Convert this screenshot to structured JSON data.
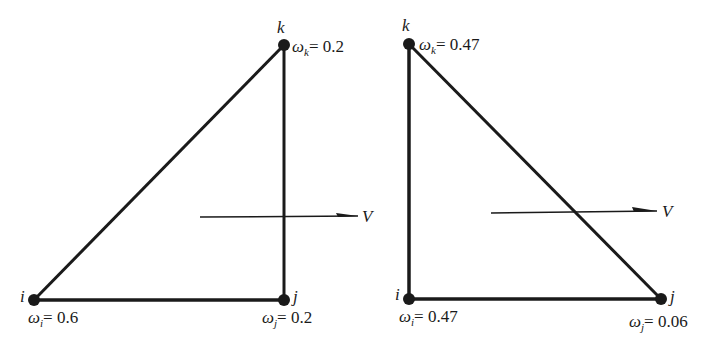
{
  "diagrams": [
    {
      "name": "left-triangle",
      "nodes": {
        "i": {
          "label": "i",
          "x": 34,
          "y": 300,
          "weight_symbol": "ω",
          "weight_sub": "i",
          "weight_eq": "= 0.6"
        },
        "j": {
          "label": "j",
          "x": 284,
          "y": 300,
          "weight_symbol": "ω",
          "weight_sub": "j",
          "weight_eq": "= 0.2"
        },
        "k": {
          "label": "k",
          "x": 284,
          "y": 45,
          "weight_symbol": "ω",
          "weight_sub": "k",
          "weight_eq": "= 0.2"
        }
      },
      "velocity": {
        "label": "V",
        "x1": 200,
        "x2": 358,
        "y": 217
      }
    },
    {
      "name": "right-triangle",
      "nodes": {
        "i": {
          "label": "i",
          "x": 409,
          "y": 299,
          "weight_symbol": "ω",
          "weight_sub": "i",
          "weight_eq": "= 0.47"
        },
        "j": {
          "label": "j",
          "x": 661,
          "y": 299,
          "weight_symbol": "ω",
          "weight_sub": "j",
          "weight_eq": "= 0.06"
        },
        "k": {
          "label": "k",
          "x": 409,
          "y": 44,
          "weight_symbol": "ω",
          "weight_sub": "k",
          "weight_eq": "= 0.47"
        }
      },
      "velocity": {
        "label": "V",
        "x1": 491,
        "x2": 657,
        "y": 212
      }
    }
  ],
  "colors": {
    "stroke": "#1a1a1a",
    "background": "#ffffff"
  }
}
